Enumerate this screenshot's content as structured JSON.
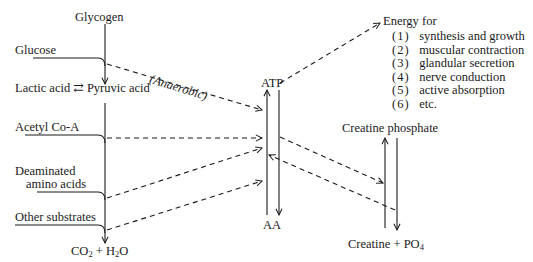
{
  "diagram": {
    "left_column": {
      "glycogen": "Glycogen",
      "glucose": "Glucose",
      "lactic_acid": "Lactic acid",
      "equilibrium_symbol": "⇄",
      "pyruvic_acid": "Pyruvic acid",
      "acetyl_coa": "Acetyl Co-A",
      "deaminated_line1": "Deaminated",
      "deaminated_line2": "amino acids",
      "other_substrates": "Other substrates",
      "end_product": {
        "co": "CO",
        "co_sub": "2",
        "plus": " + H",
        "h_sub": "2",
        "o": "O"
      }
    },
    "pathway_label": "(Anaerobic)",
    "center": {
      "atp": "ATP",
      "aa": "AA"
    },
    "energy": {
      "title": "Energy for",
      "items": [
        {
          "num": "(1)",
          "text": "synthesis and growth"
        },
        {
          "num": "(2)",
          "text": "muscular contraction"
        },
        {
          "num": "(3)",
          "text": "glandular secretion"
        },
        {
          "num": "(4)",
          "text": "nerve conduction"
        },
        {
          "num": "(5)",
          "text": "active absorption"
        },
        {
          "num": "(6)",
          "text": "etc."
        }
      ]
    },
    "right": {
      "creatine_phosphate": "Creatine phosphate",
      "creatine": "Creatine + PO",
      "po_sub": "4"
    },
    "colors": {
      "line": "#1a1a1a",
      "background": "#ffffff"
    }
  }
}
